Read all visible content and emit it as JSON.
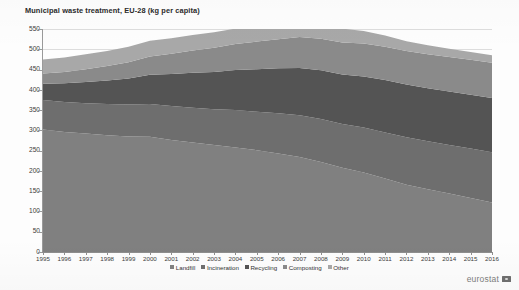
{
  "chart_data": {
    "type": "area",
    "title": "Municipal waste treatment, EU-28 (kg per capita)",
    "xlabel": "",
    "ylabel": "",
    "ylim": [
      0,
      550
    ],
    "ytick_step": 50,
    "yticks": [
      "550",
      "500",
      "450",
      "400",
      "350",
      "300",
      "250",
      "200",
      "150",
      "100",
      "50",
      "0"
    ],
    "grid": true,
    "legend_position": "bottom",
    "stacked": true,
    "categories": [
      "1995",
      "1996",
      "1997",
      "1998",
      "1999",
      "2000",
      "2001",
      "2002",
      "2003",
      "2004",
      "2005",
      "2006",
      "2007",
      "2008",
      "2009",
      "2010",
      "2011",
      "2012",
      "2013",
      "2014",
      "2015",
      "2016"
    ],
    "series": [
      {
        "name": "Landfill",
        "color": "#808080",
        "values": [
          302,
          296,
          292,
          288,
          285,
          284,
          276,
          270,
          264,
          258,
          251,
          243,
          234,
          222,
          208,
          196,
          181,
          166,
          155,
          144,
          133,
          122
        ]
      },
      {
        "name": "Incineration",
        "color": "#6e6e6e",
        "values": [
          73,
          74,
          75,
          77,
          79,
          81,
          84,
          86,
          88,
          92,
          95,
          99,
          103,
          106,
          108,
          111,
          114,
          117,
          118,
          120,
          122,
          124
        ]
      },
      {
        "name": "Recycling",
        "color": "#545454",
        "values": [
          40,
          46,
          52,
          58,
          64,
          72,
          79,
          86,
          92,
          99,
          105,
          111,
          117,
          120,
          122,
          126,
          129,
          130,
          131,
          132,
          133,
          134
        ]
      },
      {
        "name": "Composting",
        "color": "#8a8a8a",
        "values": [
          25,
          28,
          32,
          36,
          40,
          45,
          50,
          55,
          60,
          64,
          68,
          72,
          76,
          78,
          79,
          81,
          82,
          83,
          84,
          85,
          86,
          87
        ]
      },
      {
        "name": "Other",
        "color": "#a8a8a8",
        "values": [
          35,
          36,
          37,
          37,
          38,
          39,
          38,
          38,
          38,
          38,
          38,
          38,
          38,
          37,
          34,
          31,
          28,
          24,
          22,
          20,
          19,
          18
        ]
      }
    ],
    "totals": [
      475,
      480,
      488,
      496,
      506,
      521,
      527,
      535,
      542,
      551,
      557,
      563,
      568,
      563,
      551,
      545,
      534,
      520,
      510,
      501,
      493,
      485
    ],
    "annotations": []
  },
  "legend": {
    "items": [
      {
        "label": "Landfill",
        "color": "#808080"
      },
      {
        "label": "Incineration",
        "color": "#6e6e6e"
      },
      {
        "label": "Recycling",
        "color": "#545454"
      },
      {
        "label": "Composting",
        "color": "#8a8a8a"
      },
      {
        "label": "Other",
        "color": "#a8a8a8"
      }
    ]
  },
  "brand": {
    "name": "eurostat",
    "logo_icon": "eu-flag-icon"
  }
}
